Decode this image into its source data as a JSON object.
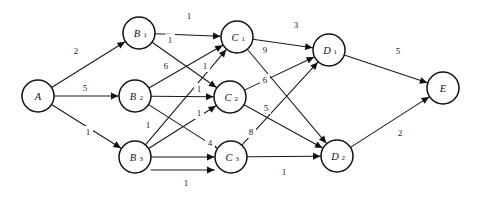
{
  "diagram": {
    "type": "directed-weighted-graph",
    "width": 477,
    "height": 197,
    "background_color": "#ffffff",
    "line_color": "#1a1a1a",
    "node_fill": "#ffffff",
    "node_stroke": "#111111",
    "node_radius": 16
  },
  "nodes": [
    {
      "id": "A",
      "base": "A",
      "sub": "",
      "x": 38,
      "y": 96,
      "r": 16
    },
    {
      "id": "B1",
      "base": "B",
      "sub": "1",
      "x": 139,
      "y": 33,
      "r": 16
    },
    {
      "id": "B2",
      "base": "B",
      "sub": "2",
      "x": 135,
      "y": 96,
      "r": 16
    },
    {
      "id": "B3",
      "base": "B",
      "sub": "3",
      "x": 135,
      "y": 157,
      "r": 16
    },
    {
      "id": "C1",
      "base": "C",
      "sub": "1",
      "x": 237,
      "y": 37,
      "r": 16
    },
    {
      "id": "C2",
      "base": "C",
      "sub": "2",
      "x": 230,
      "y": 97,
      "r": 16
    },
    {
      "id": "C3",
      "base": "C",
      "sub": "3",
      "x": 231,
      "y": 157,
      "r": 16
    },
    {
      "id": "D1",
      "base": "D",
      "sub": "1",
      "x": 329,
      "y": 50,
      "r": 16
    },
    {
      "id": "D2",
      "base": "D",
      "sub": "2",
      "x": 337,
      "y": 156,
      "r": 16
    },
    {
      "id": "E",
      "base": "E",
      "sub": "",
      "x": 443,
      "y": 88,
      "r": 16
    }
  ],
  "edges": [
    {
      "from": "A",
      "to": "B1",
      "weight": "2",
      "lx": 76,
      "ly": 51
    },
    {
      "from": "A",
      "to": "B2",
      "weight": "5",
      "lx": 85,
      "ly": 88
    },
    {
      "from": "A",
      "to": "B3",
      "weight": "1",
      "lx": 88,
      "ly": 132
    },
    {
      "from": "B1",
      "to": "C1",
      "weight": "1",
      "lx": 189,
      "ly": 16
    },
    {
      "from": "B1",
      "to": "C2",
      "weight": "1",
      "lx": 170,
      "ly": 40
    },
    {
      "from": "B2",
      "to": "C1",
      "weight": "6",
      "lx": 166,
      "ly": 66
    },
    {
      "from": "B2",
      "to": "C2",
      "weight": "1",
      "lx": 199,
      "ly": 89
    },
    {
      "from": "B2",
      "to": "C3",
      "weight": "1",
      "lx": 148,
      "ly": 125
    },
    {
      "from": "B3",
      "to": "C1",
      "weight": "1",
      "lx": 205,
      "ly": 66
    },
    {
      "from": "B3",
      "to": "C2",
      "weight": "1",
      "lx": 199,
      "ly": 113
    },
    {
      "from": "B3",
      "to": "C3",
      "weight": "4",
      "lx": 210,
      "ly": 143
    },
    {
      "from": "B3",
      "to": "C3",
      "weight": "1",
      "lx": 186,
      "ly": 183
    },
    {
      "from": "C1",
      "to": "D1",
      "weight": "3",
      "lx": 296,
      "ly": 25
    },
    {
      "from": "C1",
      "to": "D2",
      "weight": "9",
      "lx": 265,
      "ly": 50
    },
    {
      "from": "C2",
      "to": "D1",
      "weight": "6",
      "lx": 265,
      "ly": 80
    },
    {
      "from": "C2",
      "to": "D2",
      "weight": "5",
      "lx": 266,
      "ly": 108
    },
    {
      "from": "C3",
      "to": "D1",
      "weight": "8",
      "lx": 251,
      "ly": 132
    },
    {
      "from": "C3",
      "to": "D2",
      "weight": "1",
      "lx": 284,
      "ly": 172
    },
    {
      "from": "D1",
      "to": "E",
      "weight": "5",
      "lx": 398,
      "ly": 51
    },
    {
      "from": "D2",
      "to": "E",
      "weight": "2",
      "lx": 400,
      "ly": 133
    }
  ]
}
